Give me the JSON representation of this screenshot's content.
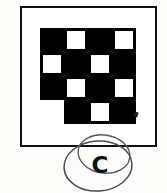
{
  "figure": {
    "kind": "checkerboard-pattern-answer-option",
    "frame": {
      "border_color": "#111111",
      "background_color": "#ffffff"
    },
    "pattern": {
      "type": "checkerboard",
      "rows": 4,
      "columns": 4,
      "cell_size_px": 24,
      "black_color": "#000000",
      "white_color": "#ffffff",
      "grid": [
        [
          "black",
          "white",
          "black",
          "white"
        ],
        [
          "white",
          "black",
          "white",
          "black"
        ],
        [
          "black",
          "white",
          "black",
          "white"
        ],
        [
          "empty",
          "black",
          "white",
          "black"
        ]
      ],
      "notes": "bottom-left cell is absent, leaving a notch in the lower-left corner"
    },
    "marks": {
      "ink_speck": "stray-ink-mark"
    },
    "answer": {
      "letter": "C",
      "annotation": "hand-drawn-circle",
      "circle_count": 2,
      "ink_color": "#4a4a52"
    }
  }
}
